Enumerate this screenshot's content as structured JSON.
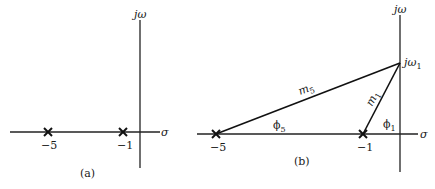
{
  "panel_a": {
    "caption": "(a)",
    "axis_vertical_label": "jω",
    "axis_horizontal_label": "σ",
    "poles": [
      {
        "value": -5,
        "label": "−5"
      },
      {
        "value": -1,
        "label": "−1"
      }
    ]
  },
  "panel_b": {
    "caption": "(b)",
    "axis_vertical_label": "jω",
    "axis_horizontal_label": "σ",
    "test_point_label": "jω",
    "test_point_sub": "1",
    "poles": [
      {
        "value": -5,
        "label": "−5"
      },
      {
        "value": -1,
        "label": "−1"
      }
    ],
    "vectors": [
      {
        "from": -5,
        "magnitude_label": "m",
        "magnitude_sub": "5",
        "angle_label": "ϕ",
        "angle_sub": "5"
      },
      {
        "from": -1,
        "magnitude_label": "m",
        "magnitude_sub": "1",
        "angle_label": "ϕ",
        "angle_sub": "1"
      }
    ]
  },
  "colors": {
    "ink": "#1a1a1a",
    "background": "#ffffff"
  }
}
